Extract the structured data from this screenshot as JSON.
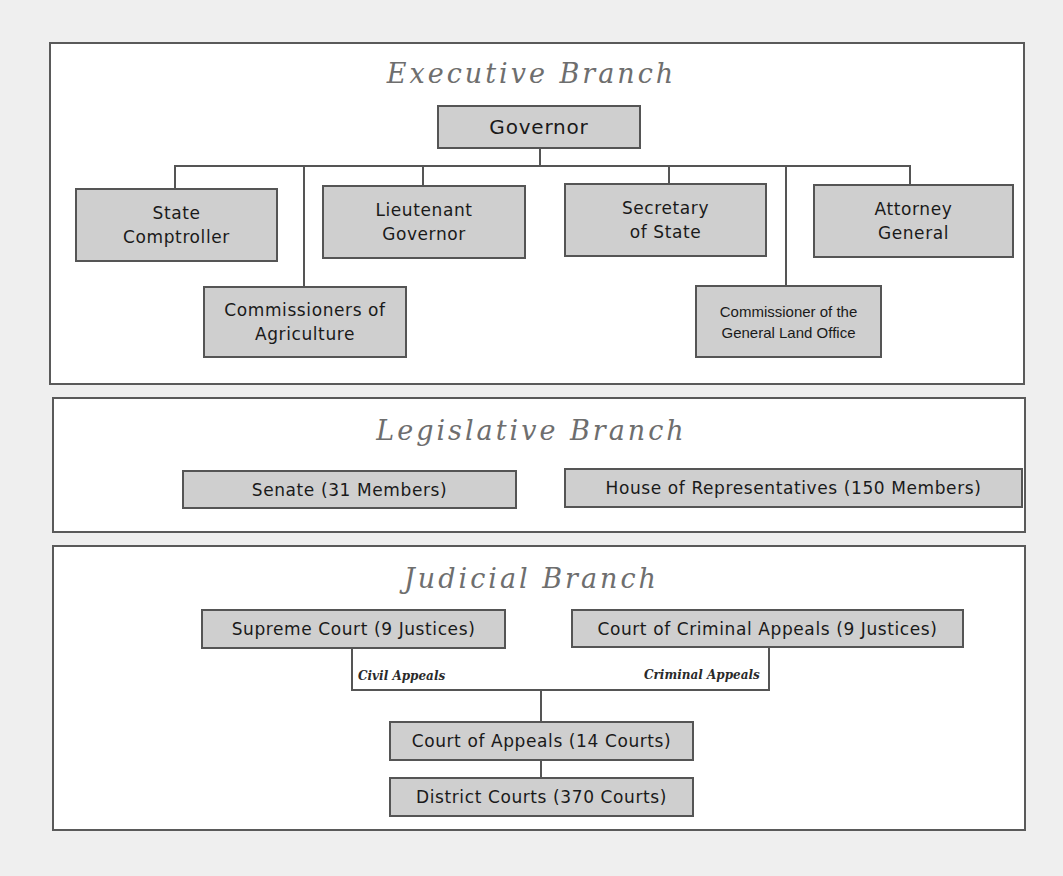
{
  "colors": {
    "page_background": "#efefef",
    "panel_background": "#ffffff",
    "panel_border": "#5a5a5a",
    "box_fill": "#cfcfcf",
    "box_border": "#555555",
    "title_text": "#6e6e6e"
  },
  "executive": {
    "title": "Executive Branch",
    "head": "Governor",
    "offices": [
      {
        "label": "State\nComptroller"
      },
      {
        "label": "Lieutenant\nGovernor"
      },
      {
        "label": "Secretary\nof State"
      },
      {
        "label": "Attorney\nGeneral"
      },
      {
        "label": "Commissioners of\nAgriculture"
      },
      {
        "label": "Commissioner of the\nGeneral Land Office"
      }
    ]
  },
  "legislative": {
    "title": "Legislative Branch",
    "chambers": [
      {
        "label": "Senate (31 Members)"
      },
      {
        "label": "House of Representatives (150 Members)"
      }
    ]
  },
  "judicial": {
    "title": "Judicial Branch",
    "high_courts": [
      {
        "label": "Supreme Court (9 Justices)"
      },
      {
        "label": "Court of Criminal Appeals (9 Justices)"
      }
    ],
    "appeal_labels": {
      "civil": "Civil Appeals",
      "criminal": "Criminal Appeals"
    },
    "lower_courts": [
      {
        "label": "Court of Appeals (14 Courts)"
      },
      {
        "label": "District Courts (370 Courts)"
      }
    ]
  }
}
